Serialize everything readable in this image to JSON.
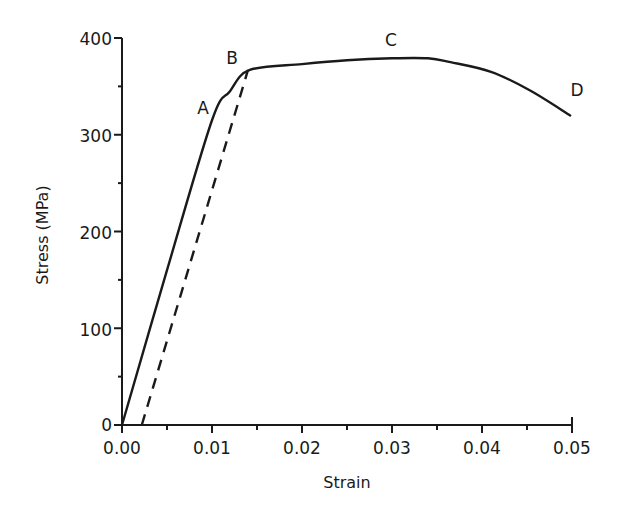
{
  "chart_data": {
    "type": "line",
    "title": "",
    "xlabel": "Strain",
    "ylabel": "Stress (MPa)",
    "xlim": [
      0,
      0.05
    ],
    "ylim": [
      0,
      400
    ],
    "grid": false,
    "legend": null,
    "x_ticks": [
      "0.00",
      "0.01",
      "0.02",
      "0.03",
      "0.04",
      "0.05"
    ],
    "y_ticks": [
      "0",
      "100",
      "200",
      "300",
      "400"
    ],
    "series": [
      {
        "name": "stress-strain curve",
        "style": "solid",
        "x": [
          0.0,
          0.005,
          0.01,
          0.012,
          0.0142,
          0.02,
          0.025,
          0.03,
          0.034,
          0.0365,
          0.041,
          0.0453,
          0.0498
        ],
        "y": [
          0,
          160,
          315,
          345,
          367,
          373,
          377,
          379,
          379,
          375,
          365,
          346,
          320
        ]
      },
      {
        "name": "unloading line",
        "style": "dashed",
        "x": [
          0.0022,
          0.014
        ],
        "y": [
          0,
          367
        ]
      }
    ],
    "annotations": [
      {
        "text": "A",
        "x": 0.0092,
        "y": 330
      },
      {
        "text": "B",
        "x": 0.0123,
        "y": 380
      },
      {
        "text": "C",
        "x": 0.03,
        "y": 398
      },
      {
        "text": "D",
        "x": 0.0505,
        "y": 344
      }
    ]
  },
  "labels": {
    "xlabel": "Strain",
    "ylabel": "Stress (MPa)",
    "x_ticks": [
      "0.00",
      "0.01",
      "0.02",
      "0.03",
      "0.04",
      "0.05"
    ],
    "y_ticks": [
      "0",
      "100",
      "200",
      "300",
      "400"
    ],
    "points": {
      "A": "A",
      "B": "B",
      "C": "C",
      "D": "D"
    }
  }
}
